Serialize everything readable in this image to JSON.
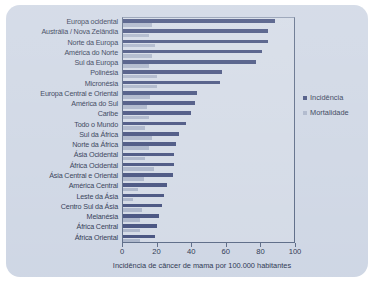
{
  "chart_data": {
    "type": "bar",
    "orientation": "horizontal",
    "title": "",
    "xlabel": "Incidência de câncer de mama por 100.000 habitantes",
    "ylabel": "",
    "xlim": [
      0,
      100
    ],
    "xticks": [
      0,
      20,
      40,
      60,
      80,
      100
    ],
    "grid": false,
    "legend_position": "right",
    "categories": [
      "Europa ocidental",
      "Austrália / Nova Zelândia",
      "Norte da Europa",
      "América do Norte",
      "Sul da Europa",
      "Polinésia",
      "Micronésia",
      "Europa Central e Oriental",
      "América do Sul",
      "Caribe",
      "Todo o  Mundo",
      "Sul da África",
      "Norte da África",
      "Ásia Ocidental",
      "África Ocidental",
      "Ásia Central e Oriental",
      "América Central",
      "Leste da Ásia",
      "Centro Sul da Ásia",
      "Melanésia",
      "África Central",
      "África Oriental"
    ],
    "series": [
      {
        "name": "Incidência",
        "color": "#44507e",
        "values": [
          89,
          85,
          85,
          81,
          78,
          58,
          57,
          43,
          42,
          40,
          37,
          33,
          31,
          30,
          30,
          29,
          26,
          24,
          23,
          21,
          20,
          19
        ]
      },
      {
        "name": "Mortalidade",
        "color": "#aab4c9",
        "values": [
          17,
          15,
          19,
          17,
          15,
          20,
          20,
          16,
          14,
          15,
          13,
          17,
          15,
          13,
          18,
          12,
          9,
          6,
          11,
          10,
          10,
          10
        ]
      }
    ]
  },
  "axis": {
    "tick_labels": [
      "0",
      "20",
      "40",
      "60",
      "80",
      "100"
    ],
    "x_title": "Incidência de câncer de mama por 100.000 habitantes"
  },
  "legend": {
    "items": [
      {
        "label": "Incidência",
        "color": "#44507e"
      },
      {
        "label": "Mortalidade",
        "color": "#aab4c9"
      }
    ]
  },
  "colors": {
    "incidence": "#44507e",
    "mortality": "#aab4c9",
    "card_background": "#ced6e4",
    "axis": "#5b6a86",
    "text": "#2c3550",
    "page_background": "#ffffff"
  }
}
